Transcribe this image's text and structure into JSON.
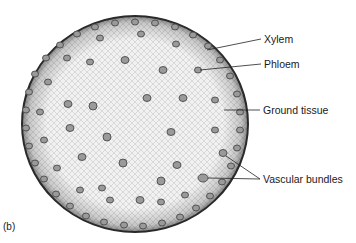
{
  "figure": {
    "panel_letter": "(b)",
    "labels": [
      {
        "id": "xylem",
        "text": "Xylem"
      },
      {
        "id": "phloem",
        "text": "Phloem"
      },
      {
        "id": "ground-tissue",
        "text": "Ground tissue"
      },
      {
        "id": "vascular-bundles",
        "text": "Vascular bundles"
      }
    ],
    "colors": {
      "background": "#ffffff",
      "tissue_fill": "#e8e8e8",
      "epidermis": "#2a2a2a",
      "bundle": "#6a6a6a",
      "text": "#1a1a1a"
    }
  }
}
